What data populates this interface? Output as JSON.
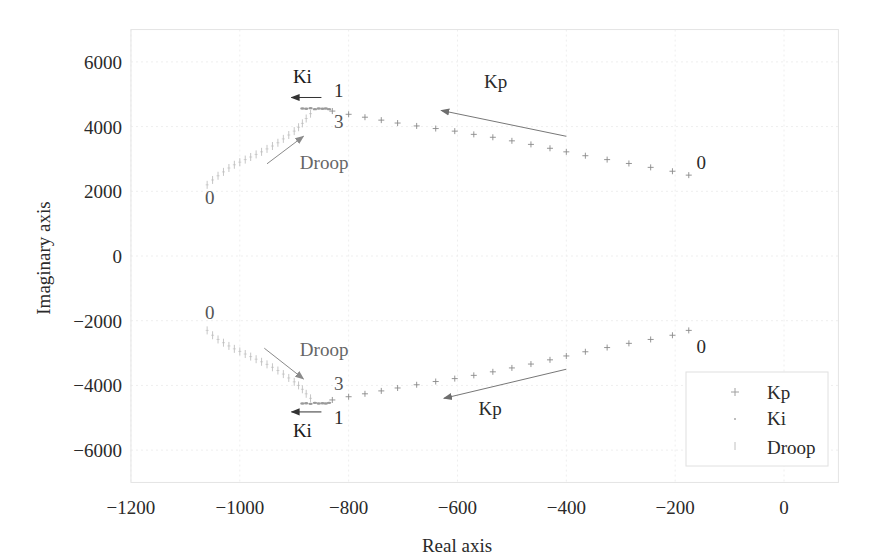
{
  "chart_data": {
    "type": "scatter",
    "title": "",
    "xlabel": "Real axis",
    "ylabel": "Imaginary axis",
    "xlim": [
      -1200,
      100
    ],
    "ylim": [
      -7000,
      7000
    ],
    "grid": true,
    "legend_position": "lower right",
    "x_ticks": [
      -1200,
      -1000,
      -800,
      -600,
      -400,
      -200,
      0
    ],
    "x_tick_labels": [
      "−1200",
      "−1000",
      "−800",
      "−600",
      "−400",
      "−200",
      "0"
    ],
    "y_ticks": [
      6000,
      4000,
      2000,
      0,
      -2000,
      -4000,
      -6000
    ],
    "y_tick_labels": [
      "6000",
      "4000",
      "2000",
      "0",
      "−2000",
      "−4000",
      "−6000"
    ],
    "series": [
      {
        "name": "Kp",
        "marker": "+",
        "color": "#8a8a8a",
        "points_upper": [
          [
            -175,
            2500
          ],
          [
            -205,
            2620
          ],
          [
            -245,
            2740
          ],
          [
            -285,
            2860
          ],
          [
            -325,
            2980
          ],
          [
            -365,
            3100
          ],
          [
            -400,
            3220
          ],
          [
            -430,
            3330
          ],
          [
            -465,
            3450
          ],
          [
            -500,
            3560
          ],
          [
            -535,
            3670
          ],
          [
            -570,
            3760
          ],
          [
            -605,
            3860
          ],
          [
            -640,
            3940
          ],
          [
            -675,
            4020
          ],
          [
            -710,
            4110
          ],
          [
            -740,
            4200
          ],
          [
            -770,
            4290
          ],
          [
            -800,
            4380
          ],
          [
            -830,
            4480
          ]
        ],
        "points_lower": [
          [
            -175,
            -2300
          ],
          [
            -205,
            -2450
          ],
          [
            -245,
            -2580
          ],
          [
            -285,
            -2700
          ],
          [
            -325,
            -2830
          ],
          [
            -365,
            -2960
          ],
          [
            -400,
            -3090
          ],
          [
            -430,
            -3210
          ],
          [
            -465,
            -3340
          ],
          [
            -500,
            -3460
          ],
          [
            -535,
            -3580
          ],
          [
            -570,
            -3690
          ],
          [
            -605,
            -3790
          ],
          [
            -640,
            -3880
          ],
          [
            -675,
            -3980
          ],
          [
            -710,
            -4080
          ],
          [
            -740,
            -4170
          ],
          [
            -770,
            -4260
          ],
          [
            -800,
            -4350
          ],
          [
            -830,
            -4450
          ]
        ]
      },
      {
        "name": "Ki",
        "marker": ".",
        "color": "#9a9a9a",
        "points_upper": [
          [
            -885,
            4560
          ],
          [
            -878,
            4550
          ],
          [
            -870,
            4570
          ],
          [
            -862,
            4540
          ],
          [
            -855,
            4560
          ],
          [
            -848,
            4550
          ],
          [
            -842,
            4560
          ],
          [
            -836,
            4540
          ]
        ],
        "points_lower": [
          [
            -885,
            -4560
          ],
          [
            -878,
            -4550
          ],
          [
            -870,
            -4570
          ],
          [
            -862,
            -4540
          ],
          [
            -855,
            -4560
          ],
          [
            -848,
            -4550
          ],
          [
            -842,
            -4560
          ],
          [
            -836,
            -4540
          ]
        ]
      },
      {
        "name": "Droop",
        "marker": "|",
        "color": "#b8b8b8",
        "points_upper": [
          [
            -1060,
            2200
          ],
          [
            -1050,
            2350
          ],
          [
            -1040,
            2480
          ],
          [
            -1030,
            2600
          ],
          [
            -1020,
            2720
          ],
          [
            -1010,
            2820
          ],
          [
            -1000,
            2900
          ],
          [
            -990,
            2980
          ],
          [
            -980,
            3060
          ],
          [
            -970,
            3140
          ],
          [
            -960,
            3220
          ],
          [
            -950,
            3310
          ],
          [
            -940,
            3400
          ],
          [
            -930,
            3500
          ],
          [
            -920,
            3620
          ],
          [
            -910,
            3740
          ],
          [
            -900,
            3860
          ],
          [
            -892,
            3980
          ],
          [
            -885,
            4100
          ],
          [
            -878,
            4250
          ],
          [
            -870,
            4400
          ]
        ],
        "points_lower": [
          [
            -1060,
            -2300
          ],
          [
            -1050,
            -2450
          ],
          [
            -1040,
            -2580
          ],
          [
            -1030,
            -2680
          ],
          [
            -1020,
            -2780
          ],
          [
            -1010,
            -2870
          ],
          [
            -1000,
            -2950
          ],
          [
            -990,
            -3030
          ],
          [
            -980,
            -3110
          ],
          [
            -970,
            -3190
          ],
          [
            -960,
            -3270
          ],
          [
            -950,
            -3350
          ],
          [
            -940,
            -3440
          ],
          [
            -930,
            -3540
          ],
          [
            -920,
            -3650
          ],
          [
            -910,
            -3770
          ],
          [
            -900,
            -3890
          ],
          [
            -892,
            -4000
          ],
          [
            -885,
            -4120
          ],
          [
            -878,
            -4260
          ],
          [
            -870,
            -4400
          ]
        ]
      }
    ],
    "annotations": [
      {
        "text": "Ki",
        "x": -885,
        "y": 5350,
        "color": "#1a1a1a",
        "anchor": "middle"
      },
      {
        "text": "1",
        "x": -818,
        "y": 4900,
        "color": "#2a2a2a",
        "anchor": "middle"
      },
      {
        "text": "3",
        "x": -818,
        "y": 3950,
        "color": "#555555",
        "anchor": "middle"
      },
      {
        "text": "Droop",
        "x": -845,
        "y": 2700,
        "color": "#666666",
        "anchor": "middle"
      },
      {
        "text": "0",
        "x": -1055,
        "y": 1600,
        "color": "#555555",
        "anchor": "middle"
      },
      {
        "text": "Kp",
        "x": -530,
        "y": 5200,
        "color": "#2a2a2a",
        "anchor": "middle"
      },
      {
        "text": "0",
        "x": -152,
        "y": 2700,
        "color": "#2a2a2a",
        "anchor": "middle"
      },
      {
        "text": "0",
        "x": -1055,
        "y": -1950,
        "color": "#555555",
        "anchor": "middle"
      },
      {
        "text": "Droop",
        "x": -845,
        "y": -3100,
        "color": "#666666",
        "anchor": "middle"
      },
      {
        "text": "3",
        "x": -818,
        "y": -4150,
        "color": "#555555",
        "anchor": "middle"
      },
      {
        "text": "1",
        "x": -818,
        "y": -5200,
        "color": "#2a2a2a",
        "anchor": "middle"
      },
      {
        "text": "Ki",
        "x": -885,
        "y": -5600,
        "color": "#1a1a1a",
        "anchor": "middle"
      },
      {
        "text": "Kp",
        "x": -540,
        "y": -4900,
        "color": "#2a2a2a",
        "anchor": "middle"
      },
      {
        "text": "0",
        "x": -152,
        "y": -3000,
        "color": "#2a2a2a",
        "anchor": "middle"
      }
    ],
    "arrows": [
      {
        "label": "Ki",
        "from": [
          -850,
          4900
        ],
        "to": [
          -905,
          4900
        ],
        "color": "#333333"
      },
      {
        "label": "Kp",
        "from": [
          -400,
          3700
        ],
        "to": [
          -630,
          4500
        ],
        "color": "#777777"
      },
      {
        "label": "Droop",
        "from": [
          -950,
          2850
        ],
        "to": [
          -883,
          3700
        ],
        "color": "#8a8a8a"
      },
      {
        "label": "Droop",
        "from": [
          -955,
          -2850
        ],
        "to": [
          -883,
          -3800
        ],
        "color": "#8a8a8a"
      },
      {
        "label": "Ki",
        "from": [
          -850,
          -4820
        ],
        "to": [
          -905,
          -4820
        ],
        "color": "#333333"
      },
      {
        "label": "Kp",
        "from": [
          -400,
          -3500
        ],
        "to": [
          -625,
          -4400
        ],
        "color": "#777777"
      }
    ],
    "legend": {
      "entries": [
        {
          "label": "Kp",
          "marker": "+"
        },
        {
          "label": "Ki",
          "marker": "."
        },
        {
          "label": "Droop",
          "marker": "|"
        }
      ]
    }
  }
}
